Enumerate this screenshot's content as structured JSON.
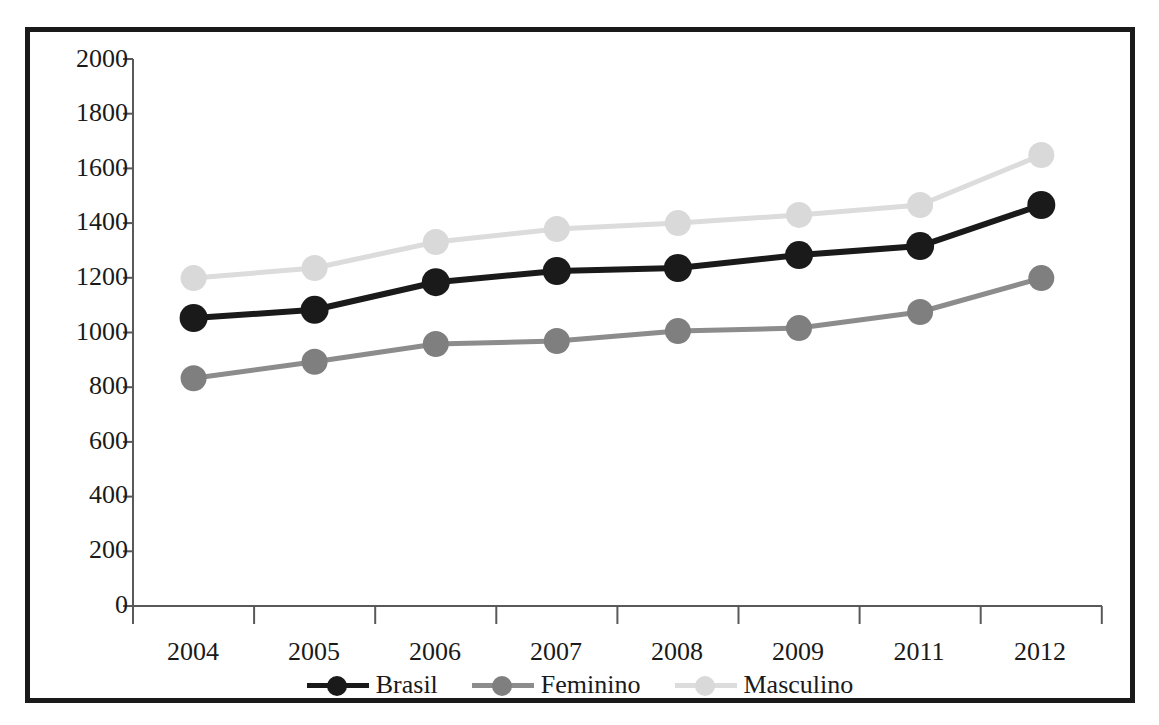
{
  "top_partial_text": "",
  "chart_data": {
    "type": "line",
    "title": "",
    "subtitle": "",
    "xlabel": "",
    "ylabel": "",
    "categories": [
      "2004",
      "2005",
      "2006",
      "2007",
      "2008",
      "2009",
      "2011",
      "2012"
    ],
    "ylim": [
      0,
      2000
    ],
    "yticks": [
      0,
      200,
      400,
      600,
      800,
      1000,
      1200,
      1400,
      1600,
      1800,
      2000
    ],
    "ytick_labels": [
      "0",
      "200",
      "400",
      "600",
      "800",
      "1000",
      "1200",
      "1400",
      "1600",
      "1800",
      "2000"
    ],
    "grid": false,
    "legend_position": "bottom",
    "markers": "circle",
    "series": [
      {
        "name": "Brasil",
        "color": "#1a1a1a",
        "values": [
          1053,
          1083,
          1184,
          1225,
          1236,
          1283,
          1316,
          1466
        ]
      },
      {
        "name": "Feminino",
        "color": "#7f7f7f",
        "values": [
          833,
          893,
          958,
          969,
          1005,
          1016,
          1075,
          1199
        ]
      },
      {
        "name": "Masculino",
        "color": "#d9d9d9",
        "values": [
          1199,
          1236,
          1331,
          1378,
          1400,
          1430,
          1466,
          1649
        ]
      }
    ]
  },
  "colors": {
    "frame_border": "#1a1a1a",
    "axis": "#595959",
    "background": "#ffffff",
    "brasil": "#1a1a1a",
    "feminino": "#7f7f7f",
    "masculino": "#d9d9d9"
  }
}
